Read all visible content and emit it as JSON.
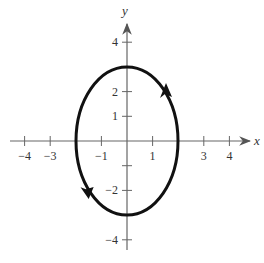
{
  "chart_data": {
    "type": "line",
    "title": "",
    "xlabel": "x",
    "ylabel": "y",
    "xlim": [
      -4.5,
      4.5
    ],
    "ylim": [
      -4.5,
      4.5
    ],
    "grid": false,
    "x_ticks": [
      -4,
      -3,
      -1,
      1,
      3,
      4
    ],
    "x_tick_labels": [
      "−4",
      "−3",
      "−1",
      "1",
      "3",
      "4"
    ],
    "y_ticks": [
      4,
      2,
      1,
      -2,
      -4
    ],
    "y_tick_labels": [
      "4",
      "2",
      "1",
      "−2",
      "−4"
    ],
    "y_unlabeled_ticks": [
      -1
    ],
    "series": [
      {
        "name": "ellipse",
        "shape": "ellipse",
        "center": [
          0,
          0
        ],
        "semi_axis_x": 2,
        "semi_axis_y": 3,
        "orientation": "counterclockwise",
        "direction_arrows": [
          {
            "at": [
              1.4,
              2.1
            ],
            "direction": "up"
          },
          {
            "at": [
              -1.4,
              -2.1
            ],
            "direction": "down"
          }
        ]
      }
    ]
  }
}
